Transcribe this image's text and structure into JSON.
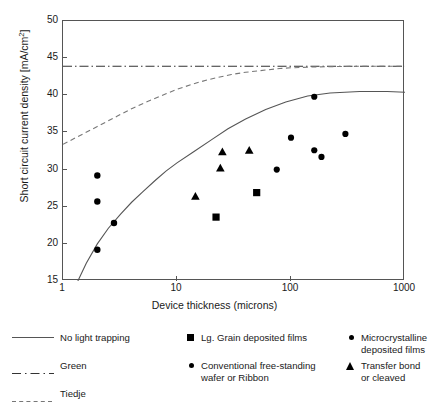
{
  "chart_data": {
    "type": "scatter",
    "title": "",
    "xlabel": "Device thickness (microns)",
    "ylabel": "Short circuit current density [mA/cm2]",
    "ylabel_html": "Short circuit current density [mA/cm<sup>2</sup>]",
    "xscale": "log",
    "yscale": "linear",
    "xlim": [
      1,
      1000
    ],
    "ylim": [
      15,
      50
    ],
    "xticks": [
      1,
      10,
      100,
      1000
    ],
    "xtick_labels": [
      "1",
      "10",
      "100",
      "1000"
    ],
    "yticks": [
      15,
      20,
      25,
      30,
      35,
      40,
      45,
      50
    ],
    "ytick_labels": [
      "15",
      "20",
      "25",
      "30",
      "35",
      "40",
      "45",
      "50"
    ],
    "grid": false,
    "legend_position": "below-plot",
    "series": [
      {
        "name": "No light trapping",
        "type": "line",
        "style": "solid",
        "color": "#555555",
        "points": [
          [
            1.35,
            15.0
          ],
          [
            1.6,
            17.4
          ],
          [
            2.0,
            20.0
          ],
          [
            2.5,
            22.1
          ],
          [
            3.2,
            24.0
          ],
          [
            4.0,
            25.6
          ],
          [
            5.0,
            27.0
          ],
          [
            6.5,
            28.6
          ],
          [
            8.0,
            29.8
          ],
          [
            10.0,
            30.9
          ],
          [
            14.0,
            32.4
          ],
          [
            20.0,
            34.0
          ],
          [
            28.0,
            35.5
          ],
          [
            40.0,
            36.8
          ],
          [
            60.0,
            38.1
          ],
          [
            90.0,
            39.1
          ],
          [
            140.0,
            39.9
          ],
          [
            220.0,
            40.3
          ],
          [
            400.0,
            40.5
          ],
          [
            700.0,
            40.5
          ],
          [
            1000.0,
            40.4
          ]
        ]
      },
      {
        "name": "Green",
        "type": "line",
        "style": "dash-dot",
        "color": "#333333",
        "points": [
          [
            1,
            43.9
          ],
          [
            1000,
            43.9
          ]
        ]
      },
      {
        "name": "Tiedje",
        "type": "line",
        "style": "dashed",
        "color": "#777777",
        "points": [
          [
            1.0,
            33.4
          ],
          [
            1.5,
            34.8
          ],
          [
            2.0,
            35.8
          ],
          [
            3.0,
            37.2
          ],
          [
            4.0,
            38.2
          ],
          [
            6.0,
            39.4
          ],
          [
            8.0,
            40.2
          ],
          [
            10.0,
            40.8
          ],
          [
            15.0,
            41.7
          ],
          [
            20.0,
            42.2
          ],
          [
            30.0,
            42.8
          ],
          [
            40.0,
            43.1
          ],
          [
            60.0,
            43.4
          ],
          [
            80.0,
            43.6
          ],
          [
            100.0,
            43.7
          ],
          [
            150.0,
            43.8
          ],
          [
            200.0,
            43.85
          ],
          [
            400.0,
            43.9
          ],
          [
            1000.0,
            43.9
          ]
        ]
      },
      {
        "name": "Lg. Grain deposited films",
        "type": "scatter",
        "marker": "square",
        "color": "#000000",
        "points": [
          [
            22.0,
            23.6
          ],
          [
            50.0,
            26.9
          ]
        ]
      },
      {
        "name": "Microcrystalline deposited films",
        "type": "scatter",
        "marker": "circle",
        "color": "#000000",
        "points": [
          [
            2.0,
            29.2
          ],
          [
            2.0,
            25.7
          ],
          [
            2.8,
            22.8
          ],
          [
            2.0,
            19.2
          ]
        ]
      },
      {
        "name": "Conventional free-standing wafer or Ribbon",
        "type": "scatter",
        "marker": "circle-large",
        "color": "#000000",
        "points": [
          [
            75.0,
            30.0
          ],
          [
            100.0,
            34.3
          ],
          [
            160.0,
            39.8
          ],
          [
            160.0,
            32.6
          ],
          [
            185.0,
            31.7
          ],
          [
            300.0,
            34.8
          ]
        ]
      },
      {
        "name": "Transfer bond or cleaved",
        "type": "scatter",
        "marker": "triangle",
        "color": "#000000",
        "points": [
          [
            14.5,
            26.4
          ],
          [
            24.0,
            30.2
          ],
          [
            25.0,
            32.4
          ],
          [
            43.0,
            32.6
          ]
        ]
      }
    ]
  },
  "legend": {
    "entries": [
      {
        "key": "line-solid",
        "label": "No light trapping"
      },
      {
        "key": "line-dashdot",
        "label": "Green"
      },
      {
        "key": "line-dashed",
        "label": "Tiedje"
      },
      {
        "key": "square",
        "label": "Lg. Grain deposited films"
      },
      {
        "key": "circle-small",
        "label": "Conventional free-standing\nwafer or Ribbon"
      },
      {
        "key": "circle-dot",
        "label": "Microcrystalline\ndeposited films"
      },
      {
        "key": "triangle",
        "label": "Transfer bond or cleaved"
      }
    ]
  },
  "colors": {
    "axis": "#555555",
    "marker": "#000000",
    "solid_line": "#555555",
    "dashdot_line": "#333333",
    "dashed_line": "#777777",
    "background": "#ffffff"
  }
}
